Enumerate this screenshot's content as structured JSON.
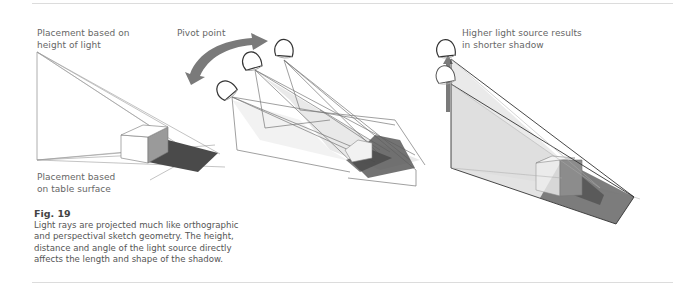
{
  "figure": {
    "number_label": "Fig. 19",
    "caption_lines": [
      "Light rays are projected much like orthographic",
      "and perspectival sketch geometry. The height,",
      "distance and angle of the light source directly",
      "affects the length and shape of the shadow."
    ]
  },
  "diagrams": {
    "left": {
      "label_top_lines": [
        "Placement based on",
        "height of light"
      ],
      "label_bottom_lines": [
        "Placement based",
        "on table surface"
      ]
    },
    "middle": {
      "label_lines": [
        "Pivot point"
      ]
    },
    "right": {
      "label_lines": [
        "Higher light source results",
        "in shorter shadow"
      ]
    }
  },
  "colors": {
    "line": "#8a8a8a",
    "dark_line": "#555555",
    "shadow": "#4a4a4a",
    "cube_face": "#9a9a9a",
    "light_fill": "#e6e6e6",
    "arrow": "#7a7a7a",
    "rule": "#dcdcdc"
  }
}
